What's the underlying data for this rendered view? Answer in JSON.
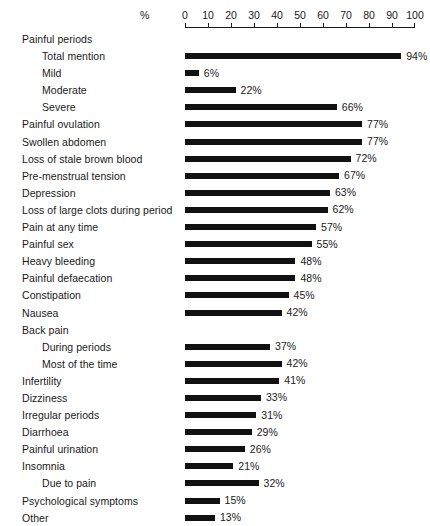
{
  "chart_data": {
    "type": "bar",
    "orientation": "horizontal",
    "title": "",
    "xlabel": "%",
    "ylabel": "",
    "xlim": [
      0,
      100
    ],
    "xticks": [
      0,
      10,
      20,
      30,
      40,
      50,
      60,
      70,
      80,
      90,
      100
    ],
    "xtick_labels": [
      "0",
      "10",
      "20",
      "30",
      "40",
      "50",
      "60",
      "70",
      "80",
      "90",
      "100"
    ],
    "grid": false,
    "legend": null,
    "value_label_suffix": "%",
    "bar_color": "#111111",
    "categories": [
      "Painful periods",
      "Total mention",
      "Mild",
      "Moderate",
      "Severe",
      "Painful ovulation",
      "Swollen abdomen",
      "Loss of stale brown blood",
      "Pre-menstrual tension",
      "Depression",
      "Loss of large clots during period",
      "Pain at any time",
      "Painful sex",
      "Heavy bleeding",
      "Painful defaecation",
      "Constipation",
      "Nausea",
      "Back pain",
      "During periods",
      "Most of the time",
      "Infertility",
      "Dizziness",
      "Irregular periods",
      "Diarrhoea",
      "Painful urination",
      "Insomnia",
      "Due to pain",
      "Psychological symptoms",
      "Other"
    ],
    "values": [
      null,
      94,
      6,
      22,
      66,
      77,
      77,
      72,
      67,
      63,
      62,
      57,
      55,
      48,
      48,
      45,
      42,
      null,
      37,
      42,
      41,
      33,
      31,
      29,
      26,
      21,
      32,
      15,
      13
    ],
    "rows": [
      {
        "label": "Painful periods",
        "value": null,
        "value_label": "",
        "indent": false,
        "header": true
      },
      {
        "label": "Total mention",
        "value": 94,
        "value_label": "94%",
        "indent": true,
        "header": false
      },
      {
        "label": "Mild",
        "value": 6,
        "value_label": "6%",
        "indent": true,
        "header": false
      },
      {
        "label": "Moderate",
        "value": 22,
        "value_label": "22%",
        "indent": true,
        "header": false
      },
      {
        "label": "Severe",
        "value": 66,
        "value_label": "66%",
        "indent": true,
        "header": false
      },
      {
        "label": "Painful ovulation",
        "value": 77,
        "value_label": "77%",
        "indent": false,
        "header": false
      },
      {
        "label": "Swollen abdomen",
        "value": 77,
        "value_label": "77%",
        "indent": false,
        "header": false
      },
      {
        "label": "Loss of stale brown blood",
        "value": 72,
        "value_label": "72%",
        "indent": false,
        "header": false
      },
      {
        "label": "Pre-menstrual tension",
        "value": 67,
        "value_label": "67%",
        "indent": false,
        "header": false
      },
      {
        "label": "Depression",
        "value": 63,
        "value_label": "63%",
        "indent": false,
        "header": false
      },
      {
        "label": "Loss of large clots during period",
        "value": 62,
        "value_label": "62%",
        "indent": false,
        "header": false
      },
      {
        "label": "Pain at any time",
        "value": 57,
        "value_label": "57%",
        "indent": false,
        "header": false
      },
      {
        "label": "Painful sex",
        "value": 55,
        "value_label": "55%",
        "indent": false,
        "header": false
      },
      {
        "label": "Heavy bleeding",
        "value": 48,
        "value_label": "48%",
        "indent": false,
        "header": false
      },
      {
        "label": "Painful defaecation",
        "value": 48,
        "value_label": "48%",
        "indent": false,
        "header": false
      },
      {
        "label": "Constipation",
        "value": 45,
        "value_label": "45%",
        "indent": false,
        "header": false
      },
      {
        "label": "Nausea",
        "value": 42,
        "value_label": "42%",
        "indent": false,
        "header": false
      },
      {
        "label": "Back pain",
        "value": null,
        "value_label": "",
        "indent": false,
        "header": true
      },
      {
        "label": "During periods",
        "value": 37,
        "value_label": "37%",
        "indent": true,
        "header": false
      },
      {
        "label": "Most of the time",
        "value": 42,
        "value_label": "42%",
        "indent": true,
        "header": false
      },
      {
        "label": "Infertility",
        "value": 41,
        "value_label": "41%",
        "indent": false,
        "header": false
      },
      {
        "label": "Dizziness",
        "value": 33,
        "value_label": "33%",
        "indent": false,
        "header": false
      },
      {
        "label": "Irregular periods",
        "value": 31,
        "value_label": "31%",
        "indent": false,
        "header": false
      },
      {
        "label": "Diarrhoea",
        "value": 29,
        "value_label": "29%",
        "indent": false,
        "header": false
      },
      {
        "label": "Painful urination",
        "value": 26,
        "value_label": "26%",
        "indent": false,
        "header": false
      },
      {
        "label": "Insomnia",
        "value": 21,
        "value_label": "21%",
        "indent": false,
        "header": false
      },
      {
        "label": "Due to pain",
        "value": 32,
        "value_label": "32%",
        "indent": true,
        "header": false
      },
      {
        "label": "Psychological symptoms",
        "value": 15,
        "value_label": "15%",
        "indent": false,
        "header": false
      },
      {
        "label": "Other",
        "value": 13,
        "value_label": "13%",
        "indent": false,
        "header": false
      }
    ]
  }
}
